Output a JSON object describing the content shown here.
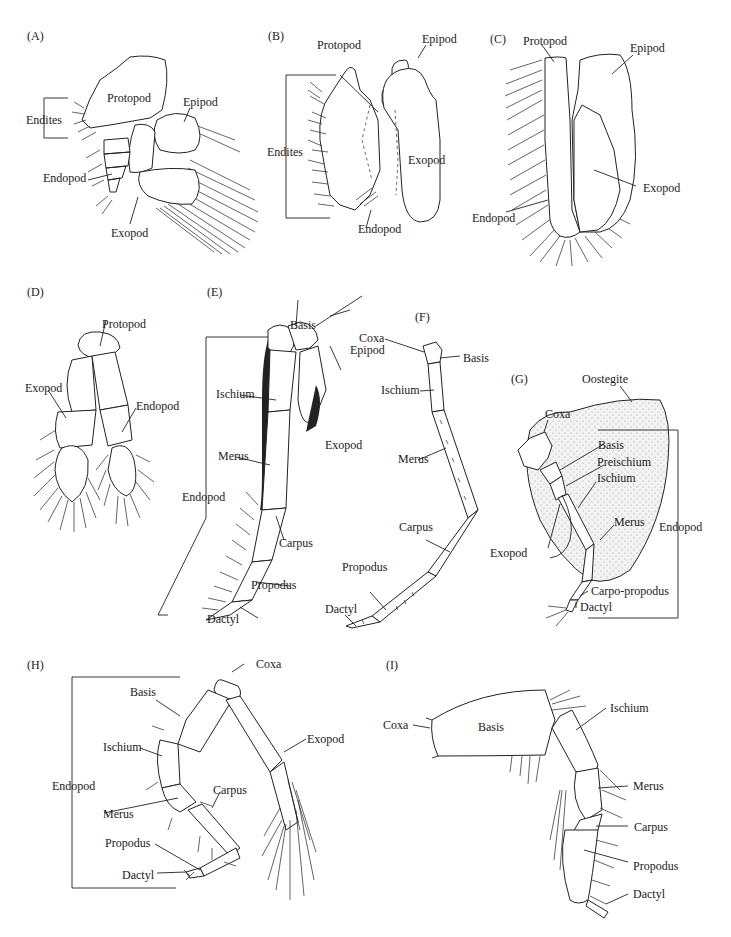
{
  "figure": {
    "panels": [
      {
        "id": "A",
        "label": "(A)",
        "parts": [
          "Protopod",
          "Epipod",
          "Endites",
          "Endopod",
          "Exopod"
        ]
      },
      {
        "id": "B",
        "label": "(B)",
        "parts": [
          "Protopod",
          "Epipod",
          "Endites",
          "Exopod",
          "Endopod"
        ]
      },
      {
        "id": "C",
        "label": "(C)",
        "parts": [
          "Protopod",
          "Epipod",
          "Exopod",
          "Endopod"
        ]
      },
      {
        "id": "D",
        "label": "(D)",
        "parts": [
          "Protopod",
          "Exopod",
          "Endopod"
        ]
      },
      {
        "id": "E",
        "label": "(E)",
        "parts": [
          "Basis",
          "Coxa",
          "Epipod",
          "Ischium",
          "Exopod",
          "Merus",
          "Endopod",
          "Carpus",
          "Propodus",
          "Dactyl"
        ]
      },
      {
        "id": "F",
        "label": "(F)",
        "parts": [
          "Coxa",
          "Basis",
          "Ischium",
          "Merus",
          "Carpus",
          "Propodus",
          "Dactyl"
        ]
      },
      {
        "id": "G",
        "label": "(G)",
        "parts": [
          "Oostegite",
          "Coxa",
          "Basis",
          "Preischium",
          "Ischium",
          "Merus",
          "Endopod",
          "Exopod",
          "Carpo-propodus",
          "Dactyl"
        ]
      },
      {
        "id": "H",
        "label": "(H)",
        "parts": [
          "Coxa",
          "Basis",
          "Exopod",
          "Ischium",
          "Endopod",
          "Carpus",
          "Merus",
          "Propodus",
          "Dactyl"
        ]
      },
      {
        "id": "I",
        "label": "(I)",
        "parts": [
          "Coxa",
          "Basis",
          "Ischium",
          "Merus",
          "Carpus",
          "Propodus",
          "Dactyl"
        ]
      }
    ]
  },
  "A": {
    "panel": "(A)",
    "protopod": "Protopod",
    "epipod": "Epipod",
    "endites": "Endites",
    "endopod": "Endopod",
    "exopod": "Exopod"
  },
  "B": {
    "panel": "(B)",
    "protopod": "Protopod",
    "epipod": "Epipod",
    "endites": "Endites",
    "exopod": "Exopod",
    "endopod": "Endopod"
  },
  "C": {
    "panel": "(C)",
    "protopod": "Protopod",
    "epipod": "Epipod",
    "exopod": "Exopod",
    "endopod": "Endopod"
  },
  "D": {
    "panel": "(D)",
    "protopod": "Protopod",
    "exopod": "Exopod",
    "endopod": "Endopod"
  },
  "E": {
    "panel": "(E)",
    "basis": "Basis",
    "coxa": "Coxa",
    "epipod": "Epipod",
    "ischium": "Ischium",
    "exopod": "Exopod",
    "merus": "Merus",
    "endopod": "Endopod",
    "carpus": "Carpus",
    "propodus": "Propodus",
    "dactyl": "Dactyl"
  },
  "F": {
    "panel": "(F)",
    "basis": "Basis",
    "ischium": "Ischium",
    "merus": "Merus",
    "carpus": "Carpus",
    "propodus": "Propodus",
    "dactyl": "Dactyl"
  },
  "G": {
    "panel": "(G)",
    "oostegite": "Oostegite",
    "coxa": "Coxa",
    "basis": "Basis",
    "preischium": "Preischium",
    "ischium": "Ischium",
    "merus": "Merus",
    "endopod": "Endopod",
    "exopod": "Exopod",
    "carpopropodus": "Carpo-propodus",
    "dactyl": "Dactyl"
  },
  "H": {
    "panel": "(H)",
    "coxa": "Coxa",
    "basis": "Basis",
    "exopod": "Exopod",
    "ischium": "Ischium",
    "endopod": "Endopod",
    "carpus": "Carpus",
    "merus": "Merus",
    "propodus": "Propodus",
    "dactyl": "Dactyl"
  },
  "I": {
    "panel": "(I)",
    "coxa": "Coxa",
    "basis": "Basis",
    "ischium": "Ischium",
    "merus": "Merus",
    "carpus": "Carpus",
    "propodus": "Propodus",
    "dactyl": "Dactyl"
  }
}
